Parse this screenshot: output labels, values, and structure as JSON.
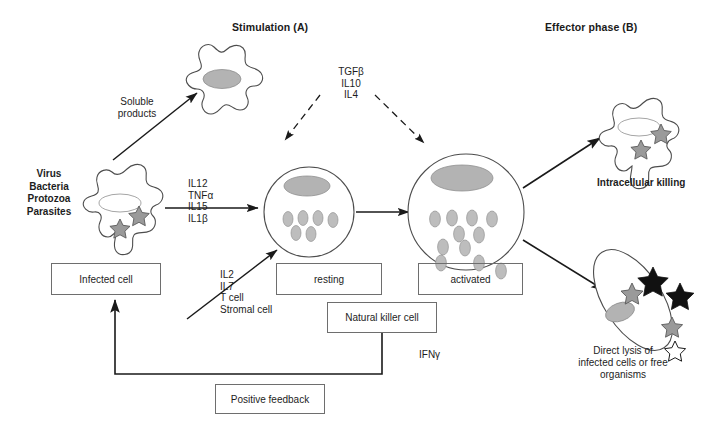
{
  "figure": {
    "headings": {
      "stimulation": "Stimulation (A)",
      "effector": "Effector phase (B)"
    },
    "labels": {
      "pathogens": "Virus\nBacteria\nProtozoa\nParasites",
      "soluble_products": "Soluble\nproducts",
      "stimulatory_cytokines": "IL12\nTNFα\nIL15\nIL1β",
      "inhibitory_cytokines": "TGFβ\nIL10\nIL4",
      "growth_factors": "IL2\nIL7\nT cell\nStromal cell",
      "ifn_gamma": "IFNγ",
      "intracellular_killing": "Intracellular killing",
      "direct_lysis_bold": "Direct lysis",
      "direct_lysis_rest": " of\ninfected cells or free\norganisms"
    },
    "boxes": {
      "infected_cell": "Infected cell",
      "resting": "resting",
      "activated": "activated",
      "natural_killer_cell": "Natural killer cell",
      "positive_feedback": "Positive feedback"
    },
    "colors": {
      "stroke": "#4d4d4d",
      "line": "#1a1a1a",
      "nucleus_fill": "#b3b3b3",
      "granule_fill": "#bdbdbd",
      "star_gray": "#9a9a9a",
      "star_black": "#111111",
      "star_white": "#ffffff",
      "box_border": "#6e6e6e",
      "text": "#1d1d1d"
    },
    "icons": {
      "macrophage": "macrophage-cell-icon",
      "infected_macrophage": "infected-macrophage-icon",
      "resting_nk": "resting-nk-cell-icon",
      "activated_nk": "activated-nk-cell-icon",
      "killing_macrophage": "intracellular-killing-cell-icon",
      "lysed_cell": "lysed-target-cell-icon",
      "star_pathogen": "star-pathogen-icon",
      "arrow_solid": "solid-arrow-icon",
      "arrow_dashed": "dashed-arrow-icon"
    }
  }
}
